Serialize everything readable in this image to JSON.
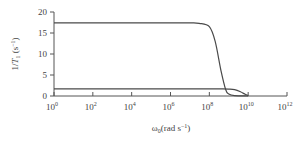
{
  "chart_data": {
    "type": "line",
    "title": "",
    "xlabel": "ω0(rad s−1)",
    "ylabel": "1/T1 (s−1)",
    "xscale": "log",
    "xlim": [
      1,
      1000000000000.0
    ],
    "ylim": [
      0,
      20
    ],
    "x_ticks": [
      "10^0",
      "10^2",
      "10^4",
      "10^6",
      "10^8",
      "10^10",
      "10^12"
    ],
    "y_ticks": [
      0,
      5,
      10,
      15,
      20
    ],
    "grid": false,
    "legend": null,
    "series": [
      {
        "name": "curve-high",
        "x": [
          1,
          100.0,
          10000.0,
          1000000.0,
          10000000.0,
          30000000.0,
          100000000.0,
          200000000.0,
          400000000.0,
          700000000.0,
          1000000000.0,
          2000000000.0,
          10000000000.0
        ],
        "y": [
          17.4,
          17.4,
          17.4,
          17.4,
          17.4,
          17.3,
          16.5,
          13.0,
          6.0,
          1.5,
          0.5,
          0.1,
          0.0
        ]
      },
      {
        "name": "curve-low",
        "x": [
          1,
          100.0,
          10000.0,
          1000000.0,
          100000000.0,
          500000000.0,
          1000000000.0,
          2000000000.0,
          4000000000.0,
          7000000000.0,
          10000000000.0
        ],
        "y": [
          1.7,
          1.7,
          1.7,
          1.7,
          1.7,
          1.7,
          1.65,
          1.5,
          1.0,
          0.4,
          0.1
        ]
      }
    ]
  },
  "labels": {
    "x_ticks": [
      {
        "base": "10",
        "exp": "0"
      },
      {
        "base": "10",
        "exp": "2"
      },
      {
        "base": "10",
        "exp": "4"
      },
      {
        "base": "10",
        "exp": "6"
      },
      {
        "base": "10",
        "exp": "8"
      },
      {
        "base": "10",
        "exp": "10"
      },
      {
        "base": "10",
        "exp": "12"
      }
    ],
    "y_ticks": [
      "0",
      "5",
      "10",
      "15",
      "20"
    ],
    "xlabel": {
      "main": "ω",
      "sub": "0",
      "rest": "(rad s",
      "sup": "−1",
      "end": ")"
    },
    "ylabel": {
      "main": "1/",
      "italic": "T",
      "sub": "1",
      "rest": " (s",
      "sup": "−1",
      "end": ")"
    }
  }
}
